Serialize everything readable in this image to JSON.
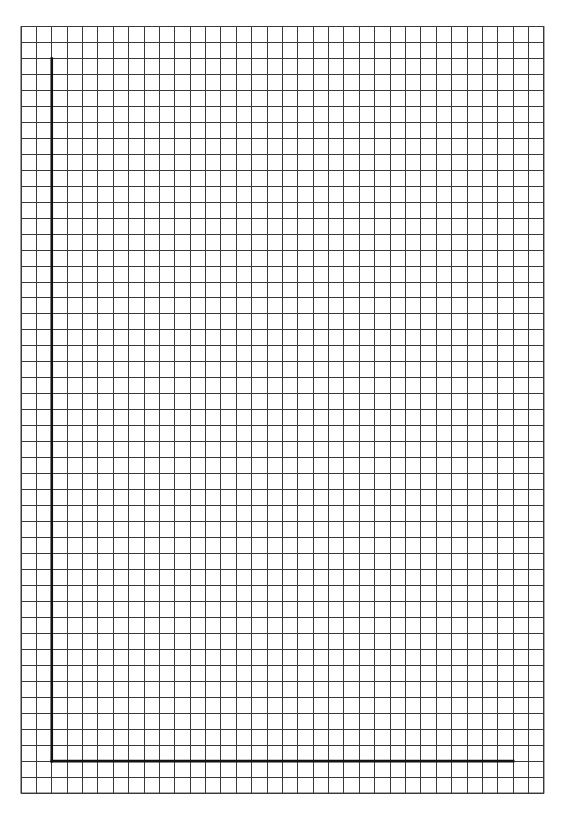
{
  "page": {
    "type": "graph-paper-worksheet",
    "background": "#ffffff"
  },
  "grid": {
    "left": 21,
    "top": 26.5,
    "columns": 34,
    "rows": 48,
    "cell_width": 15.38,
    "cell_height": 15.97,
    "line_color": "#3a3a3a"
  },
  "axes": {
    "color": "#111111",
    "origin_col": 2,
    "origin_row": 46,
    "y_axis_top_row": 2,
    "x_axis_end_col": 32,
    "x_label": "",
    "y_label": ""
  }
}
